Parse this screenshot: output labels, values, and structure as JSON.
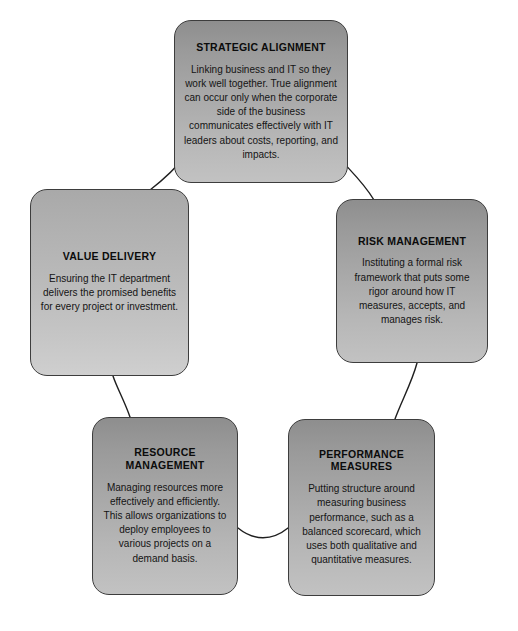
{
  "diagram": {
    "type": "cycle",
    "accent_color": "#a8a8a8",
    "border_color": "#3d3d3d",
    "text_color": "#111111",
    "background": "#ffffff",
    "nodes": [
      {
        "id": "strategic-alignment",
        "title": "STRATEGIC ALIGNMENT",
        "body": "Linking business and IT so they work well together. True alignment can occur only when the corporate side of the business communicates effectively with IT leaders about costs, reporting, and impacts."
      },
      {
        "id": "risk-management",
        "title": "RISK MANAGEMENT",
        "body": "Instituting a formal risk framework that puts some rigor around how IT measures, accepts, and manages risk."
      },
      {
        "id": "performance-measures",
        "title": "PERFORMANCE MEASURES",
        "body": "Putting structure around measuring business performance, such as a balanced scorecard, which uses both qualitative and quantitative measures."
      },
      {
        "id": "resource-management",
        "title": "RESOURCE\nMANAGEMENT",
        "body": "Managing resources more effectively and efficiently. This allows organizations to deploy employees to various projects on a demand basis."
      },
      {
        "id": "value-delivery",
        "title": "VALUE DELIVERY",
        "body": "Ensuring the IT department delivers the promised benefits for every project or investment."
      }
    ],
    "connectors": [
      {
        "from": "strategic-alignment",
        "to": "risk-management"
      },
      {
        "from": "risk-management",
        "to": "performance-measures"
      },
      {
        "from": "performance-measures",
        "to": "resource-management"
      },
      {
        "from": "resource-management",
        "to": "value-delivery"
      },
      {
        "from": "value-delivery",
        "to": "strategic-alignment"
      }
    ]
  }
}
